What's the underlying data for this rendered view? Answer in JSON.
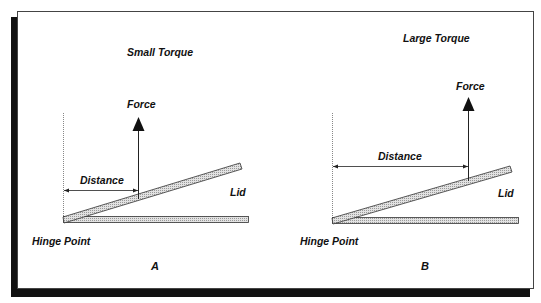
{
  "figure": {
    "type": "torque-comparison-diagram",
    "colors": {
      "frame_border": "#444444",
      "shadow": "#111111",
      "bar_fill": "#d9d9d9",
      "bar_stroke": "#333333",
      "line": "#222222",
      "dotted_guide": "#888888"
    }
  },
  "panels": [
    {
      "id": "A",
      "title": "Small Torque",
      "force_label": "Force",
      "distance_label": "Distance",
      "lid_label": "Lid",
      "hinge_label": "Hinge Point",
      "panel_letter": "A"
    },
    {
      "id": "B",
      "title": "Large Torque",
      "force_label": "Force",
      "distance_label": "Distance",
      "lid_label": "Lid",
      "hinge_label": "Hinge Point",
      "panel_letter": "B"
    }
  ]
}
